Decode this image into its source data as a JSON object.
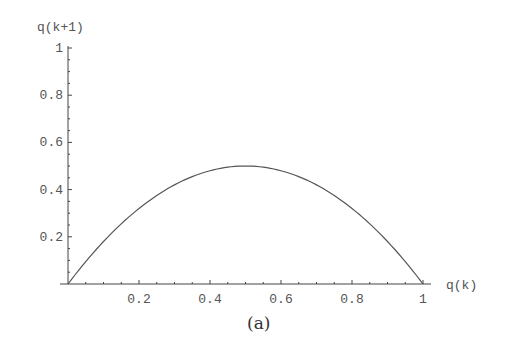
{
  "chart_data": {
    "type": "line",
    "title": "",
    "caption": "(a)",
    "xlabel": "q(k)",
    "ylabel": "q(k+1)",
    "xlim": [
      0,
      1
    ],
    "ylim": [
      0,
      1
    ],
    "grid": false,
    "legend": null,
    "x_ticks": [
      "0.2",
      "0.4",
      "0.6",
      "0.8",
      "1"
    ],
    "y_ticks": [
      "0.2",
      "0.4",
      "0.6",
      "0.8",
      "1"
    ],
    "x_tick_values": [
      0.2,
      0.4,
      0.6,
      0.8,
      1.0
    ],
    "y_tick_values": [
      0.2,
      0.4,
      0.6,
      0.8,
      1.0
    ],
    "series": [
      {
        "name": "q(k+1) = 2 q(k) (1 - q(k))",
        "x": [
          0,
          0.1,
          0.2,
          0.3,
          0.4,
          0.5,
          0.6,
          0.7,
          0.8,
          0.9,
          1.0
        ],
        "values": [
          0,
          0.18,
          0.32,
          0.42,
          0.48,
          0.5,
          0.48,
          0.42,
          0.32,
          0.18,
          0
        ]
      }
    ],
    "colors": {
      "line": "#555555",
      "axis": "#444444",
      "text": "#555555"
    }
  }
}
